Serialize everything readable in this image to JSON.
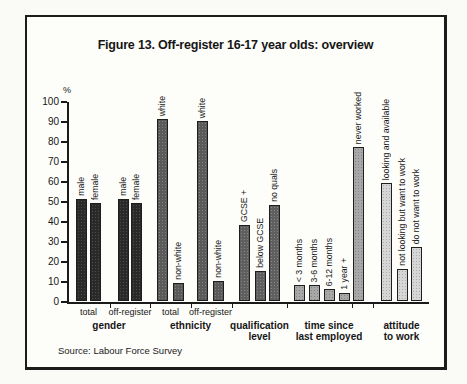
{
  "figure": {
    "title": "Figure 13. Off-register 16-17 year olds: overview",
    "source": "Source: Labour Force Survey"
  },
  "chart_data": {
    "type": "bar",
    "title": "Figure 13. Off-register 16-17 year olds: overview",
    "source": "Source: Labour Force Survey",
    "ylabel": "%",
    "ylim": [
      0,
      100
    ],
    "y_ticks": [
      100,
      90,
      80,
      70,
      60,
      50,
      40,
      30,
      20,
      10,
      0
    ],
    "grid": false,
    "legend": false,
    "groups": [
      {
        "label": "gender",
        "fill": "#2a2a2a",
        "dot": "rgba(255,255,255,0.16)",
        "subgroups": [
          {
            "label": "total",
            "bars": [
              {
                "label": "male",
                "value": 51
              },
              {
                "label": "female",
                "value": 49
              }
            ]
          },
          {
            "label": "off-register",
            "bars": [
              {
                "label": "male",
                "value": 51
              },
              {
                "label": "female",
                "value": 49
              }
            ]
          }
        ]
      },
      {
        "label": "ethnicity",
        "fill": "#5a5a5a",
        "dot": "rgba(255,255,255,0.25)",
        "subgroups": [
          {
            "label": "total",
            "bars": [
              {
                "label": "white",
                "value": 91
              },
              {
                "label": "non-white",
                "value": 9
              }
            ]
          },
          {
            "label": "off-register",
            "bars": [
              {
                "label": "white",
                "value": 90
              },
              {
                "label": "non-white",
                "value": 10
              }
            ]
          }
        ]
      },
      {
        "label": "qualification\nlevel",
        "fill": "#5f5f5f",
        "dot": "rgba(255,255,255,0.25)",
        "subgroups": [
          {
            "label": "",
            "bars": [
              {
                "label": "GCSE +",
                "value": 38
              },
              {
                "label": "below GCSE",
                "value": 15
              },
              {
                "label": "no quals",
                "value": 48
              }
            ]
          }
        ]
      },
      {
        "label": "time since\nlast employed",
        "fill": "#a8a8a8",
        "dot": "rgba(0,0,0,0.22)",
        "subgroups": [
          {
            "label": "",
            "bars": [
              {
                "label": "< 3 months",
                "value": 8
              },
              {
                "label": "3-6 months",
                "value": 8
              },
              {
                "label": "6-12 months",
                "value": 6
              },
              {
                "label": "1 year +",
                "value": 4
              }
            ]
          },
          {
            "label": "",
            "bars": [
              {
                "label": "never worked",
                "value": 77
              }
            ]
          }
        ]
      },
      {
        "label": "attitude\nto work",
        "fill": "#d6d6d6",
        "dot": "rgba(0,0,0,0.20)",
        "subgroups": [
          {
            "label": "",
            "bars": [
              {
                "label": "looking and available",
                "value": 59
              },
              {
                "label": "not looking but want to work",
                "value": 16
              },
              {
                "label": "do not want to work",
                "value": 27
              }
            ]
          }
        ]
      }
    ]
  }
}
